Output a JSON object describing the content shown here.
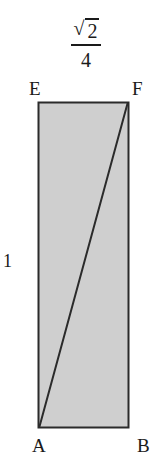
{
  "figure": {
    "type": "geometry-diagram",
    "shape": "rectangle",
    "fill_color": "#cfcfcf",
    "stroke_color": "#2b2b2b",
    "vertices": [
      {
        "id": "E",
        "label": "E",
        "position": "top-left"
      },
      {
        "id": "F",
        "label": "F",
        "position": "top-right"
      },
      {
        "id": "A",
        "label": "A",
        "position": "bottom-left"
      },
      {
        "id": "B",
        "label": "B",
        "position": "bottom-right"
      }
    ],
    "diagonal": {
      "from": "A",
      "to": "F"
    },
    "measurements": {
      "width": {
        "numerator_symbol": "√",
        "numerator_value": "2",
        "denominator": "4",
        "plain": "√2/4"
      },
      "height": {
        "value": "1"
      }
    }
  }
}
